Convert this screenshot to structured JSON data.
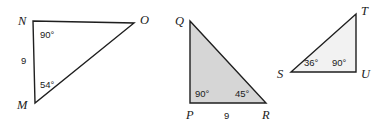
{
  "figure": {
    "background_color": "#ffffff",
    "stroke_color": "#1f1f1f",
    "triangles": [
      {
        "id": "MNO",
        "fill": "#ffffff",
        "shaded": "false",
        "vertices": [
          {
            "name": "N",
            "label": "N",
            "x": 33,
            "y": 21
          },
          {
            "name": "O",
            "label": "O",
            "x": 134,
            "y": 23
          },
          {
            "name": "M",
            "label": "M",
            "x": 35,
            "y": 103
          }
        ],
        "vertex_labels": [
          {
            "text": "N",
            "x": 18,
            "y": 25
          },
          {
            "text": "O",
            "x": 140,
            "y": 24
          },
          {
            "text": "M",
            "x": 17,
            "y": 109
          }
        ],
        "angles": [
          {
            "text": "90°",
            "at": "N",
            "x": 40,
            "y": 38
          },
          {
            "text": "54°",
            "at": "M",
            "x": 40,
            "y": 88
          }
        ],
        "sides": [
          {
            "text": "9",
            "between": "MN",
            "x": 21,
            "y": 64
          }
        ]
      },
      {
        "id": "PQR",
        "fill": "#d6d6d6",
        "shaded": "true",
        "vertices": [
          {
            "name": "Q",
            "label": "Q",
            "x": 190,
            "y": 21
          },
          {
            "name": "R",
            "label": "R",
            "x": 266,
            "y": 103
          },
          {
            "name": "P",
            "label": "P",
            "x": 190,
            "y": 103
          }
        ],
        "vertex_labels": [
          {
            "text": "Q",
            "x": 175,
            "y": 25
          },
          {
            "text": "P",
            "x": 186,
            "y": 119
          },
          {
            "text": "R",
            "x": 262,
            "y": 119
          }
        ],
        "angles": [
          {
            "text": "90°",
            "at": "P",
            "x": 195,
            "y": 97
          },
          {
            "text": "45°",
            "at": "R",
            "x": 235,
            "y": 97
          }
        ],
        "sides": [
          {
            "text": "9",
            "between": "PR",
            "x": 224,
            "y": 119
          }
        ]
      },
      {
        "id": "STU",
        "fill": "#f2f2f2",
        "shaded": "false",
        "vertices": [
          {
            "name": "T",
            "label": "T",
            "x": 356,
            "y": 14
          },
          {
            "name": "U",
            "label": "U",
            "x": 356,
            "y": 72
          },
          {
            "name": "S",
            "label": "S",
            "x": 291,
            "y": 72
          }
        ],
        "vertex_labels": [
          {
            "text": "T",
            "x": 361,
            "y": 15
          },
          {
            "text": "S",
            "x": 277,
            "y": 78
          },
          {
            "text": "U",
            "x": 361,
            "y": 78
          }
        ],
        "angles": [
          {
            "text": "36°",
            "at": "S",
            "x": 304,
            "y": 66
          },
          {
            "text": "90°",
            "at": "U",
            "x": 332,
            "y": 66
          }
        ],
        "sides": []
      }
    ]
  }
}
